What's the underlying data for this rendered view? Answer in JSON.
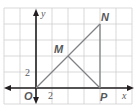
{
  "figure": {
    "type": "coordinate-geometry-diagram",
    "axes": {
      "x_label": "x",
      "y_label": "y",
      "origin_label": "O",
      "x_tick_label": "2",
      "y_tick_label": "2",
      "units_per_cell": 2
    },
    "points": [
      {
        "name": "O",
        "x": 0,
        "y": 0
      },
      {
        "name": "M",
        "x": 4,
        "y": 4
      },
      {
        "name": "N",
        "x": 8,
        "y": 8
      },
      {
        "name": "P",
        "x": 8,
        "y": 0
      }
    ],
    "segments": [
      {
        "from": "O",
        "to": "N"
      },
      {
        "from": "N",
        "to": "P"
      },
      {
        "from": "M",
        "to": "P"
      }
    ],
    "labels": {
      "M": "M",
      "N": "N",
      "P": "P"
    },
    "colors": {
      "grid": "#c8c8c8",
      "axis": "#231f20",
      "segment": "#808285",
      "label": "#58595b"
    }
  }
}
